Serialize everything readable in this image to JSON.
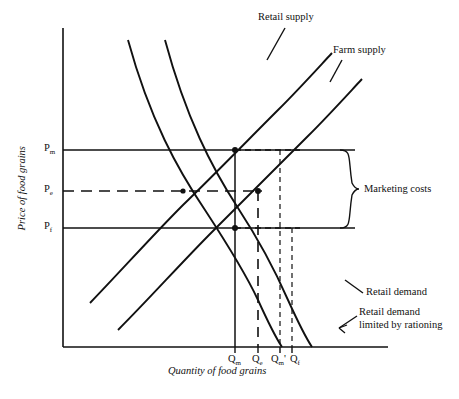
{
  "figure": {
    "type": "supply-demand-diagram",
    "background": "#ffffff",
    "ink": "#111111",
    "width": 459,
    "height": 399
  },
  "axes": {
    "y_title": "Price of food grains",
    "x_title": "Quantity of food grains",
    "origin_px": [
      63,
      347
    ],
    "y_top_px": 28,
    "x_right_px": 388
  },
  "price_ticks": [
    {
      "key": "Pm",
      "base": "P",
      "sub": "m",
      "y_px": 150,
      "line_style": "solid"
    },
    {
      "key": "Pe",
      "base": "P",
      "sub": "e",
      "y_px": 191,
      "line_style": "dashed"
    },
    {
      "key": "Pf",
      "base": "P",
      "sub": "f",
      "y_px": 228,
      "line_style": "solid"
    }
  ],
  "quantity_ticks": [
    {
      "key": "Qm",
      "base": "Q",
      "sub": "m",
      "prime": "",
      "x_px": 235,
      "line_style": "solid"
    },
    {
      "key": "Qe",
      "base": "Q",
      "sub": "e",
      "prime": "",
      "x_px": 258,
      "line_style": "dashed"
    },
    {
      "key": "Qm_prime",
      "base": "Q",
      "sub": "m",
      "prime": "'",
      "x_px": 280,
      "line_style": "dashed"
    },
    {
      "key": "Qf",
      "base": "Q",
      "sub": "f",
      "prime": "",
      "x_px": 292,
      "line_style": "dashed"
    }
  ],
  "curves": [
    {
      "key": "retail-supply",
      "label": "Retail supply",
      "slope": "upward",
      "label_pos_px": [
        258,
        12
      ]
    },
    {
      "key": "farm-supply",
      "label": "Farm supply",
      "slope": "upward",
      "label_pos_px": [
        333,
        45
      ]
    },
    {
      "key": "retail-demand",
      "label": "Retail demand",
      "slope": "downward",
      "label_pos_px": [
        366,
        292
      ]
    },
    {
      "key": "retail-demand-rationed",
      "label_line1": "Retail demand",
      "label_line2": "limited by rationing",
      "slope": "downward",
      "label_pos_px": [
        359,
        313
      ]
    }
  ],
  "annotations": {
    "marketing_costs": {
      "label": "Marketing costs",
      "brace_x_px": 355,
      "brace_top_px": 150,
      "brace_bottom_px": 228,
      "label_pos_px": [
        366,
        185
      ]
    }
  },
  "equilibria": [
    {
      "key": "retail-market",
      "at": [
        "Qm",
        "Pm"
      ],
      "px": [
        235,
        150
      ]
    },
    {
      "key": "rationed-left",
      "at": [
        "Qm",
        "Pf"
      ],
      "px": [
        235,
        228
      ]
    },
    {
      "key": "farm-market",
      "at": [
        "Qe",
        "Pe"
      ],
      "px": [
        258,
        191
      ]
    },
    {
      "key": "demand-cross",
      "at": [
        "Qe",
        "Pe"
      ],
      "px": [
        183,
        191
      ]
    }
  ]
}
